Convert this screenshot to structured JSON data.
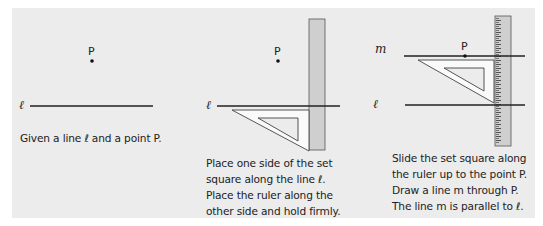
{
  "colors": {
    "background": "#ffffff",
    "panel": "#ececec",
    "ink": "#222222",
    "ruler_fill": "#cfcfcf",
    "setsquare_fill": "#fafafa"
  },
  "panels": [
    {
      "step": 1,
      "labels": {
        "line": "ℓ",
        "point": "P"
      },
      "caption": [
        "Given a line ℓ and a point P."
      ]
    },
    {
      "step": 2,
      "labels": {
        "line": "ℓ",
        "point": "P"
      },
      "caption": [
        "Place one side of the set",
        "square along the line ℓ.",
        "Place the ruler along the",
        "other side and hold firmly."
      ]
    },
    {
      "step": 3,
      "labels": {
        "line": "ℓ",
        "parallel_line": "m",
        "point": "P"
      },
      "caption": [
        "Slide the set square along",
        "the ruler up to the point P.",
        "Draw a line m through P.",
        "The line m is parallel to ℓ."
      ]
    }
  ]
}
